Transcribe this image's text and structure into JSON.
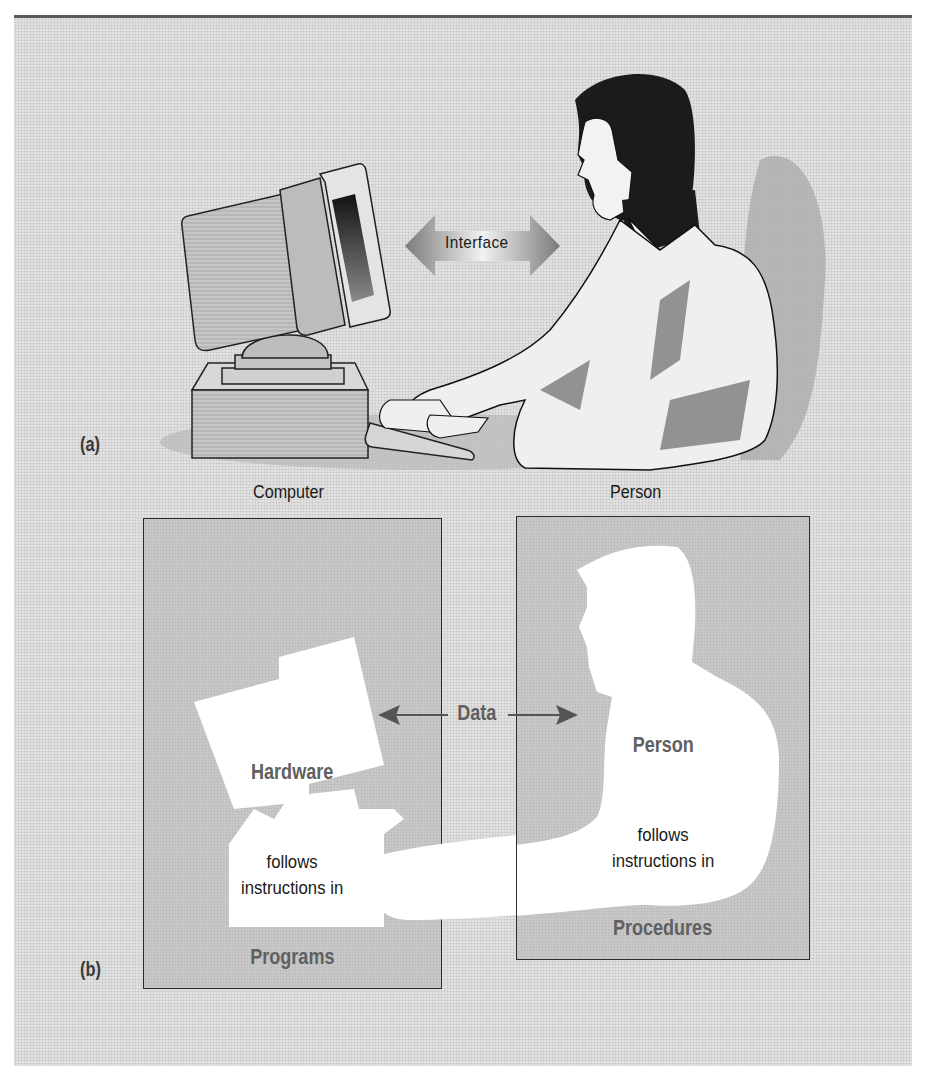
{
  "figure": {
    "part_a": {
      "label": "(a)",
      "interface_arrow_label": "Interface",
      "computer_caption": "Computer",
      "person_caption": "Person"
    },
    "part_b": {
      "label": "(b)",
      "data_arrow_label": "Data",
      "left_box": {
        "title": "Hardware",
        "body_line1": "follows",
        "body_line2": "instructions in",
        "footer": "Programs"
      },
      "right_box": {
        "title": "Person",
        "body_line1": "follows",
        "body_line2": "instructions in",
        "footer": "Procedures"
      }
    },
    "colors": {
      "panel_background": "#dcdcdc",
      "box_fill": "#c8c8c8",
      "label_gray": "#606060",
      "outline": "#2a2a2a",
      "rule": "#5a5a5a"
    }
  }
}
